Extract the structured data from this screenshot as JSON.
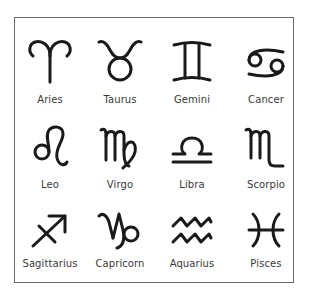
{
  "figure": {
    "signs": [
      {
        "name": "Aries",
        "symbol": "♈",
        "icon": "aries-icon"
      },
      {
        "name": "Taurus",
        "symbol": "♉",
        "icon": "taurus-icon"
      },
      {
        "name": "Gemini",
        "symbol": "♊",
        "icon": "gemini-icon"
      },
      {
        "name": "Cancer",
        "symbol": "♋",
        "icon": "cancer-icon"
      },
      {
        "name": "Leo",
        "symbol": "♌",
        "icon": "leo-icon"
      },
      {
        "name": "Virgo",
        "symbol": "♍",
        "icon": "virgo-icon"
      },
      {
        "name": "Libra",
        "symbol": "♎",
        "icon": "libra-icon"
      },
      {
        "name": "Scorpio",
        "symbol": "♏",
        "icon": "scorpio-icon"
      },
      {
        "name": "Sagittarius",
        "symbol": "♐",
        "icon": "sagittarius-icon"
      },
      {
        "name": "Capricorn",
        "symbol": "♑",
        "icon": "capricorn-icon"
      },
      {
        "name": "Aquarius",
        "symbol": "♒",
        "icon": "aquarius-icon"
      },
      {
        "name": "Pisces",
        "symbol": "♓",
        "icon": "pisces-icon"
      }
    ],
    "caption": ""
  },
  "colors": {
    "glyph": "#1a1a1a",
    "label": "#3a3a3a",
    "border": "#6a6a6a"
  }
}
